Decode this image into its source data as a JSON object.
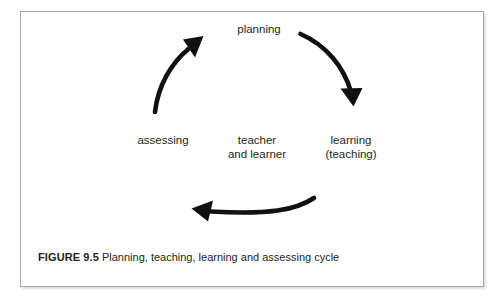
{
  "figure": {
    "caption_label": "FIGURE 9.5",
    "caption_text": "Planning, teaching, learning and assessing cycle",
    "background_color": "#ffffff",
    "border_color": "#a6a6a6",
    "ink_color": "#231f20"
  },
  "diagram": {
    "type": "cycle",
    "center_label_line1": "teacher",
    "center_label_line2": "and learner",
    "nodes": [
      {
        "id": "planning",
        "label": "planning",
        "position": "top"
      },
      {
        "id": "learning",
        "label_line1": "learning",
        "label_line2": "(teaching)",
        "position": "right"
      },
      {
        "id": "assessing",
        "label": "assessing",
        "position": "left"
      }
    ],
    "arrows": [
      {
        "id": "planning-to-learning",
        "from": "planning",
        "to": "learning",
        "direction": "clockwise"
      },
      {
        "id": "learning-to-assessing",
        "from": "learning",
        "to": "assessing",
        "direction": "clockwise"
      },
      {
        "id": "assessing-to-planning",
        "from": "assessing",
        "to": "planning",
        "direction": "clockwise"
      }
    ]
  }
}
